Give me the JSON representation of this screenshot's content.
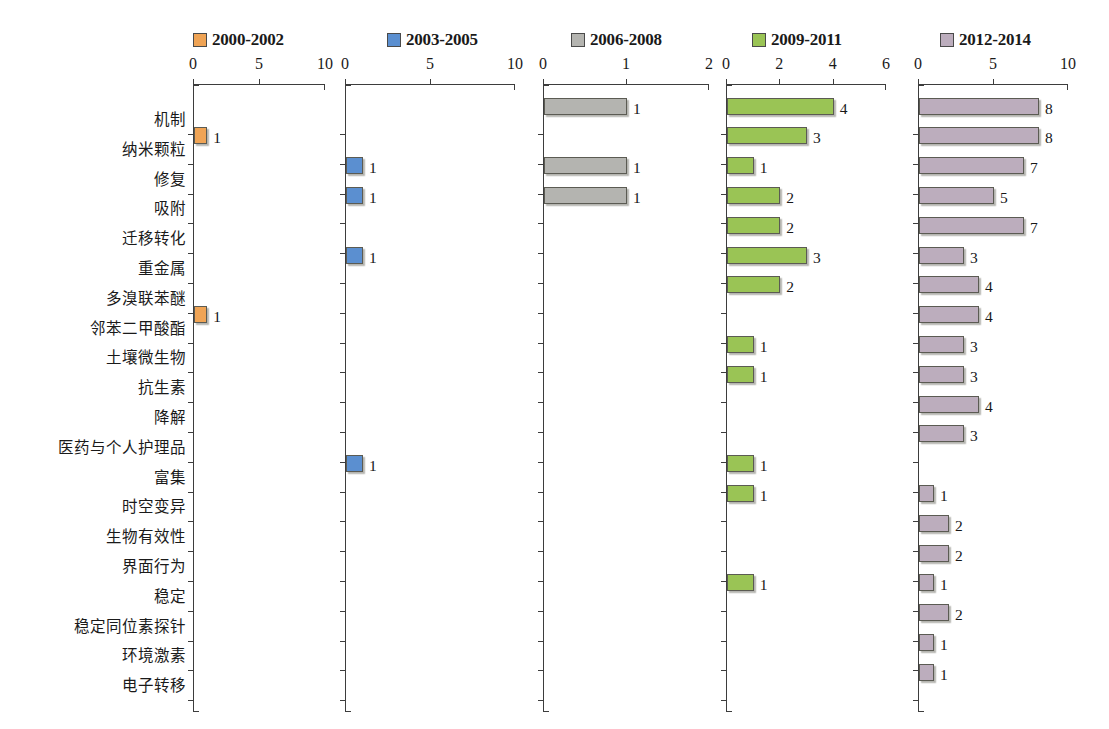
{
  "chart_data": {
    "type": "bar",
    "title": "",
    "subtitle": "",
    "xlabel": "",
    "ylabel": "",
    "orientation": "horizontal",
    "layout": "small-multiples, 5 panels side by side sharing one category axis",
    "grid": false,
    "legend_position": "top",
    "categories": [
      "机制",
      "纳米颗粒",
      "修复",
      "吸附",
      "迁移转化",
      "重金属",
      "多溴联苯醚",
      "邻苯二甲酸酯",
      "土壤微生物",
      "抗生素",
      "降解",
      "医药与个人护理品",
      "富集",
      "时空变异",
      "生物有效性",
      "界面行为",
      "稳定",
      "稳定同位素探针",
      "环境激素",
      "电子转移"
    ],
    "series": [
      {
        "name": "2000-2002",
        "color": "#F0A455",
        "xlim": [
          0,
          10
        ],
        "ticks": [
          0,
          5,
          10
        ],
        "tick_labels": [
          "0",
          "5",
          "10"
        ],
        "values": [
          0,
          1,
          0,
          0,
          0,
          0,
          0,
          1,
          0,
          0,
          0,
          0,
          0,
          0,
          0,
          0,
          0,
          0,
          0,
          0
        ]
      },
      {
        "name": "2003-2005",
        "color": "#5B8FD0",
        "xlim": [
          0,
          10
        ],
        "ticks": [
          0,
          5,
          10
        ],
        "tick_labels": [
          "0",
          "5",
          "10"
        ],
        "values": [
          0,
          0,
          1,
          1,
          0,
          1,
          0,
          0,
          0,
          0,
          0,
          0,
          1,
          0,
          0,
          0,
          0,
          0,
          0,
          0
        ]
      },
      {
        "name": "2006-2008",
        "color": "#B4B4B0",
        "xlim": [
          0,
          2
        ],
        "ticks": [
          0,
          1,
          2
        ],
        "tick_labels": [
          "0",
          "1",
          "2"
        ],
        "values": [
          1,
          0,
          1,
          1,
          0,
          0,
          0,
          0,
          0,
          0,
          0,
          0,
          0,
          0,
          0,
          0,
          0,
          0,
          0,
          0
        ]
      },
      {
        "name": "2009-2011",
        "color": "#9AC455",
        "xlim": [
          0,
          6
        ],
        "ticks": [
          0,
          2,
          4,
          6
        ],
        "tick_labels": [
          "0",
          "2",
          "4",
          "6"
        ],
        "values": [
          4,
          3,
          1,
          2,
          2,
          3,
          2,
          0,
          1,
          1,
          0,
          0,
          1,
          1,
          0,
          0,
          1,
          0,
          0,
          0
        ]
      },
      {
        "name": "2012-2014",
        "color": "#BCADBD",
        "xlim": [
          0,
          10
        ],
        "ticks": [
          0,
          5,
          10
        ],
        "tick_labels": [
          "0",
          "5",
          "10"
        ],
        "values": [
          8,
          8,
          7,
          5,
          7,
          3,
          4,
          4,
          3,
          3,
          4,
          3,
          0,
          1,
          2,
          2,
          1,
          2,
          1,
          1
        ]
      }
    ]
  },
  "legend": {
    "items": [
      {
        "label": "2000-2002",
        "color": "#F0A455"
      },
      {
        "label": "2003-2005",
        "color": "#5B8FD0"
      },
      {
        "label": "2006-2008",
        "color": "#B4B4B0"
      },
      {
        "label": "2009-2011",
        "color": "#9AC455"
      },
      {
        "label": "2012-2014",
        "color": "#BCADBD"
      }
    ]
  },
  "colors": {
    "axis": "#3d3d3d",
    "bar_border": "#5b5b53",
    "text": "#1a1a1a",
    "background": "#ffffff"
  }
}
